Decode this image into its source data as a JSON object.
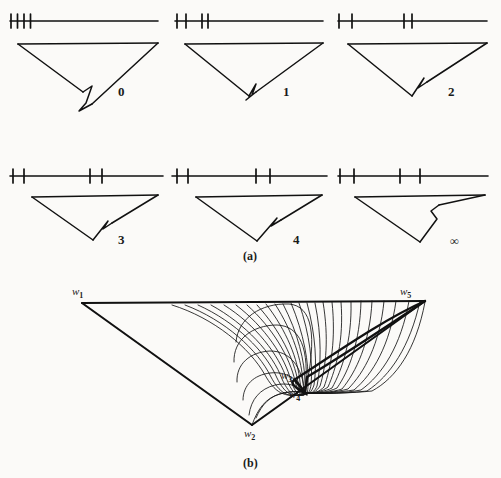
{
  "figure": {
    "width": 501,
    "height": 478,
    "background": "#fbfaf8",
    "ink": "#111111",
    "captions": [
      {
        "name": "caption-a",
        "text": "(a)",
        "x": 243,
        "y": 250
      },
      {
        "name": "caption-b",
        "text": "(b)",
        "x": 243,
        "y": 457
      }
    ]
  },
  "part_a": {
    "panels": [
      {
        "id": "panel-0",
        "label": "0",
        "label_x": 118,
        "label_y": 92,
        "axis": {
          "x1": 10,
          "x2": 158,
          "y": 21
        },
        "ticks": [
          11,
          17.5,
          24,
          30.5
        ],
        "triangle": {
          "left_x": 18,
          "right_x": 158,
          "top_y": 44,
          "apex_x": 92,
          "apex_y": 104
        },
        "notch": {
          "type": "deep-droop",
          "depth": 34,
          "width": 18
        }
      },
      {
        "id": "panel-1",
        "label": "1",
        "label_x": 283,
        "label_y": 92,
        "axis": {
          "x1": 175,
          "x2": 323,
          "y": 21
        },
        "ticks": [
          177,
          190,
          204,
          210
        ],
        "triangle": {
          "left_x": 185,
          "right_x": 323,
          "top_y": 44,
          "apex_x": 255,
          "apex_y": 98
        },
        "notch": {
          "type": "short-droop",
          "depth": 14,
          "width": 12
        }
      },
      {
        "id": "panel-2",
        "label": "2",
        "label_x": 448,
        "label_y": 92,
        "axis": {
          "x1": 338,
          "x2": 487,
          "y": 21
        },
        "ticks": [
          339,
          352,
          404,
          414
        ],
        "triangle": {
          "left_x": 348,
          "right_x": 487,
          "top_y": 44,
          "apex_x": 420,
          "apex_y": 96
        },
        "notch": {
          "type": "tick-notch",
          "depth": 8,
          "width": 7
        }
      },
      {
        "id": "panel-3",
        "label": "3",
        "label_x": 118,
        "label_y": 240,
        "axis": {
          "x1": 10,
          "x2": 163,
          "y": 176
        },
        "ticks": [
          13,
          24,
          92,
          103
        ],
        "triangle": {
          "left_x": 32,
          "right_x": 158,
          "top_y": 196,
          "apex_x": 98,
          "apex_y": 244
        },
        "notch": {
          "type": "arrow-notch",
          "depth": 9,
          "width": 8
        }
      },
      {
        "id": "panel-4",
        "label": "4",
        "label_x": 293,
        "label_y": 240,
        "axis": {
          "x1": 172,
          "x2": 327,
          "y": 176
        },
        "ticks": [
          177,
          188,
          258,
          272
        ],
        "triangle": {
          "left_x": 196,
          "right_x": 322,
          "top_y": 196,
          "apex_x": 262,
          "apex_y": 244
        },
        "notch": {
          "type": "arrow-notch",
          "depth": 10,
          "width": 9
        }
      },
      {
        "id": "panel-5",
        "label": "∞",
        "label_x": 452,
        "label_y": 239,
        "axis": {
          "x1": 338,
          "x2": 488,
          "y": 176
        },
        "ticks": [
          340,
          354,
          400,
          420
        ],
        "triangle": {
          "left_x": 355,
          "right_x": 485,
          "top_y": 196,
          "apex_x": 420,
          "apex_y": 244
        },
        "notch": {
          "type": "zigzag",
          "depth": 12,
          "width": 8
        }
      }
    ]
  },
  "part_b": {
    "vertices": [
      {
        "name": "w1",
        "label": "w",
        "sub": "1",
        "px": 82,
        "py": 303,
        "label_x": 72,
        "label_y": 288
      },
      {
        "name": "w2",
        "label": "w",
        "sub": "2",
        "px": 252,
        "py": 425,
        "label_x": 244,
        "label_y": 428
      },
      {
        "name": "w3",
        "label": "w",
        "sub": "3",
        "px": 294,
        "py": 380,
        "label_x": 283,
        "label_y": 373
      },
      {
        "name": "w4",
        "label": "w",
        "sub": "4",
        "px": 305,
        "py": 393,
        "label_x": 291,
        "label_y": 391
      },
      {
        "name": "w5",
        "label": "w",
        "sub": "5",
        "px": 425,
        "py": 301,
        "label_x": 400,
        "label_y": 287
      }
    ],
    "spiral": {
      "curve_count": 26,
      "focus_x": 305,
      "focus_y": 393,
      "description": "family of nested arcs spiralling into w4"
    }
  }
}
